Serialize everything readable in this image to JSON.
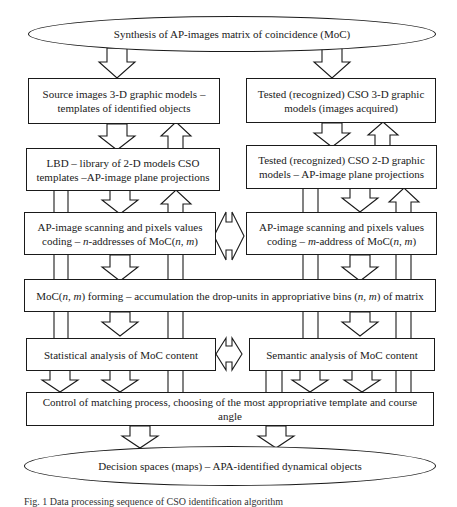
{
  "diagram": {
    "top_ellipse": "Synthesis of AP-images matrix of coincidence (MoC)",
    "left_column": {
      "box1": [
        "Source images 3-D graphic models –",
        "templates of identified objects"
      ],
      "box2": [
        "LBD – library of 2-D models CSO",
        "templates –AP-image plane projections"
      ],
      "box3": [
        "AP-image scanning and pixels values",
        "coding – n-addresses of MoC(n, m)"
      ],
      "box5": "Statistical analysis of MoC content"
    },
    "right_column": {
      "box1": [
        "Tested (recognized) CSO 3-D graphic",
        "models (images acquired)"
      ],
      "box2": [
        "Tested (recognized) CSO 2-D graphic",
        "models – AP-image plane projections"
      ],
      "box3": [
        "AP-image scanning and pixels values",
        "coding – m-address of MoC(n, m)"
      ],
      "box5": "Semantic analysis of MoC content"
    },
    "moc_forming": "MoC(n, m) forming – accumulation the drop-units in appropriative bins (n, m) of matrix",
    "control_box": "Control of matching process, choosing of the most appropriative template and course angle",
    "bottom_ellipse": "Decision spaces (maps) – APA-identified dynamical objects",
    "caption": "Fig. 1 Data processing sequence of CSO identification algorithm"
  }
}
